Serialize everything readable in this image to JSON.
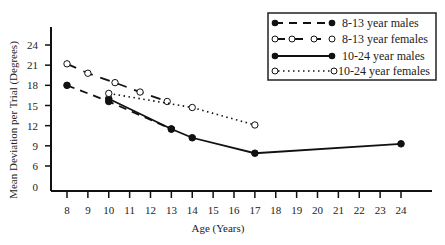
{
  "chart_data": {
    "type": "line",
    "title": "",
    "xlabel": "Age (Years)",
    "ylabel": "Mean Deviation per Trial (Degrees)",
    "x_ticks": [
      8,
      9,
      10,
      11,
      12,
      13,
      14,
      15,
      16,
      17,
      18,
      19,
      20,
      21,
      22,
      23,
      24
    ],
    "y_ticks": [
      0,
      6,
      9,
      12,
      15,
      18,
      21,
      24
    ],
    "xlim": [
      8,
      24
    ],
    "ylim": [
      0,
      24
    ],
    "y_axis_break": "0 to 6 compressed",
    "grid": false,
    "legend_position": "top-right (boxed)",
    "series": [
      {
        "name": "8-13 year males",
        "style": "dashed",
        "marker": "filled-circle",
        "x": [
          8,
          10,
          13
        ],
        "values": [
          18.0,
          15.6,
          11.5
        ]
      },
      {
        "name": "8-13 year females",
        "style": "long-dash",
        "marker": "open-circle",
        "x": [
          8,
          9,
          10.3,
          11.5,
          12.8
        ],
        "values": [
          21.2,
          19.8,
          18.4,
          17.0,
          15.6
        ]
      },
      {
        "name": "10-24 year males",
        "style": "solid",
        "marker": "filled-circle",
        "x": [
          10,
          13,
          14,
          17,
          24
        ],
        "values": [
          16.0,
          11.5,
          10.2,
          7.9,
          9.3
        ]
      },
      {
        "name": "10-24 year females",
        "style": "dotted",
        "marker": "open-circle",
        "x": [
          10,
          14,
          17
        ],
        "values": [
          16.8,
          14.7,
          12.1
        ]
      }
    ]
  },
  "legend": {
    "items": [
      {
        "label": "8-13 year males"
      },
      {
        "label": "8-13 year females"
      },
      {
        "label": "10-24 year males"
      },
      {
        "label": "10-24 year females"
      }
    ]
  },
  "axes": {
    "x_title": "Age (Years)",
    "y_title": "Mean Deviation per Trial (Degrees)"
  }
}
